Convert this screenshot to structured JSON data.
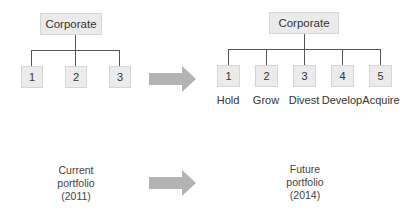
{
  "left_tree": {
    "root": "Corporate",
    "children": [
      "1",
      "2",
      "3"
    ]
  },
  "right_tree": {
    "root": "Corporate",
    "children": [
      {
        "number": "1",
        "label": "Hold"
      },
      {
        "number": "2",
        "label": "Grow"
      },
      {
        "number": "3",
        "label": "Divest"
      },
      {
        "number": "4",
        "label": "Develop"
      },
      {
        "number": "5",
        "label": "Acquire"
      }
    ]
  },
  "captions": {
    "current": [
      "Current",
      "portfolio",
      "(2011)"
    ],
    "future": [
      "Future",
      "portfolio",
      "(2014)"
    ]
  },
  "colors": {
    "box_fill": "#ebebeb",
    "box_border": "#d6d6d6",
    "connector": "#555555",
    "arrow": "#b3b3b3"
  }
}
